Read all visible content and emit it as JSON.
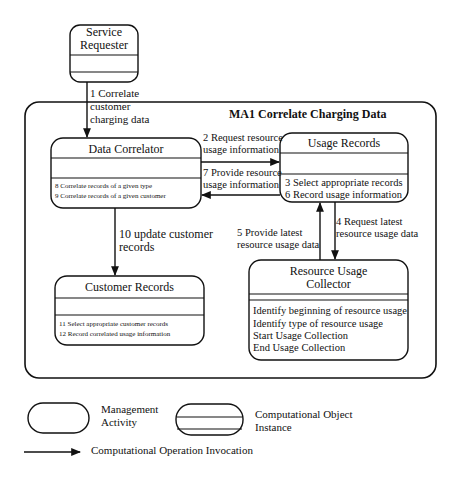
{
  "diagram": {
    "title": "MA1 Correlate Charging Data",
    "objects": {
      "service_requester": {
        "name_line1": "Service",
        "name_line2": "Requester",
        "operations": []
      },
      "data_correlator": {
        "name": "Data Correlator",
        "operations": [
          "8  Correlate records of a given type",
          "9 Correlate records of a given customer"
        ]
      },
      "usage_records": {
        "name": "Usage Records",
        "operations": [
          "3 Select appropriate records",
          "6 Record usage information"
        ]
      },
      "customer_records": {
        "name": "Customer Records",
        "operations": [
          "11 Select appropriate customer records",
          "12 Record correlated usage information"
        ]
      },
      "resource_usage_collector": {
        "name_line1": "Resource Usage",
        "name_line2": "Collector",
        "operations": [
          "Identify beginning of resource usage",
          "Identify type of resource usage",
          "Start Usage Collection",
          "End Usage Collection"
        ]
      }
    },
    "invocations": [
      {
        "id": 1,
        "line1": "1 Correlate",
        "line2": "customer",
        "line3": "charging data"
      },
      {
        "id": 2,
        "line1": "2 Request resource",
        "line2": "usage information"
      },
      {
        "id": 7,
        "line1": "7 Provide resource",
        "line2": "usage information"
      },
      {
        "id": 4,
        "line1": "4 Request latest",
        "line2": "resource usage data"
      },
      {
        "id": 5,
        "line1": "5 Provide latest",
        "line2": "resource usage data"
      },
      {
        "id": 10,
        "line1": "10 update customer",
        "line2": "records"
      }
    ]
  },
  "legend": {
    "management_activity": {
      "line1": "Management",
      "line2": "Activity"
    },
    "computational_object": {
      "line1": "Computational Object",
      "line2": "Instance"
    },
    "operation_invocation": "Computational Operation Invocation"
  }
}
